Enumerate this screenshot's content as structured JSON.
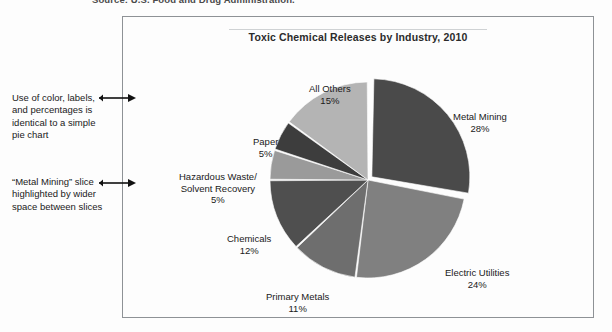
{
  "source_caption": "Source: U.S. Food and Drug Administration.",
  "chart": {
    "title": "Toxic Chemical Releases by Industry, 2010"
  },
  "annotations": [
    {
      "id": "annotation-color-labels",
      "text": "Use of color, labels, and percentages is identical to a simple pie chart",
      "arrow_icon": "arrow-right-icon"
    },
    {
      "id": "annotation-exploded-slice",
      "text": "“Metal Mining” slice highlighted by wider space between slices",
      "arrow_icon": "arrow-right-icon"
    }
  ],
  "chart_data": {
    "type": "pie",
    "title": "Toxic Chemical Releases by Industry, 2010",
    "xlabel": "",
    "ylabel": "",
    "legend_position": "none",
    "labels_show_percent": true,
    "exploded_slice": "Metal Mining",
    "slices": [
      {
        "label": "Metal Mining",
        "value": 28,
        "percent_text": "28%",
        "color": "#4a4a4a",
        "exploded": true
      },
      {
        "label": "Electric Utilities",
        "value": 24,
        "percent_text": "24%",
        "color": "#808080",
        "exploded": false
      },
      {
        "label": "Primary Metals",
        "value": 11,
        "percent_text": "11%",
        "color": "#6e6e6e",
        "exploded": false
      },
      {
        "label": "Chemicals",
        "value": 12,
        "percent_text": "12%",
        "color": "#4f4f4f",
        "exploded": false
      },
      {
        "label": "Hazardous Waste/ Solvent Recovery",
        "label_line1": "Hazardous Waste/",
        "label_line2": "Solvent Recovery",
        "value": 5,
        "percent_text": "5%",
        "color": "#9a9a9a",
        "exploded": false
      },
      {
        "label": "Paper",
        "value": 5,
        "percent_text": "5%",
        "color": "#3d3d3d",
        "exploded": false
      },
      {
        "label": "All Others",
        "value": 15,
        "percent_text": "15%",
        "color": "#b4b4b4",
        "exploded": false
      }
    ]
  }
}
